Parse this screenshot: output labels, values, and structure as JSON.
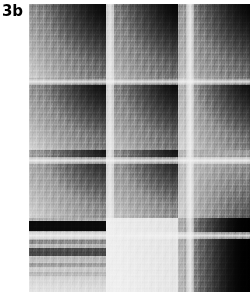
{
  "figure": {
    "panel_label": "3b",
    "type": "grayscale-heatmap"
  },
  "chart_data": {
    "type": "heatmap",
    "title": "3b",
    "xlabel": "",
    "ylabel": "",
    "colormap": "grayscale",
    "colormap_low": "#000000",
    "colormap_high": "#ffffff",
    "grid": false,
    "legend": "none",
    "xtick_labels": [],
    "ytick_labels": [],
    "plot_area": {
      "x": 29,
      "y": 4,
      "width": 221,
      "height": 288
    },
    "block_structure": {
      "column_group_widths_px": [
        77,
        72,
        72
      ],
      "row_group_heights_px": [
        74,
        72,
        68,
        74
      ],
      "column_gutter_px": 8,
      "row_gutter_px": 7
    },
    "blocks": [
      {
        "row": 0,
        "col": 0,
        "corner_dark": "top-right",
        "min_value": 0.04,
        "max_value": 0.78,
        "c_tl": "#8f8f8f",
        "c_tr": "#121212",
        "c_bl": "#d2d2d2",
        "c_br": "#6e6e6e"
      },
      {
        "row": 0,
        "col": 1,
        "corner_dark": "top-right",
        "min_value": 0.02,
        "max_value": 0.74,
        "c_tl": "#8a8a8a",
        "c_tr": "#0a0a0a",
        "c_bl": "#c9c9c9",
        "c_br": "#686868"
      },
      {
        "row": 0,
        "col": 2,
        "corner_dark": "top-right",
        "min_value": 0.03,
        "max_value": 0.72,
        "c_tl": "#9a9a9a",
        "c_tr": "#0d0d0d",
        "c_bl": "#c6c6c6",
        "c_br": "#6a6a6a"
      },
      {
        "row": 1,
        "col": 0,
        "corner_dark": "top-right",
        "min_value": 0.06,
        "max_value": 0.8,
        "c_tl": "#8d8d8d",
        "c_tr": "#1a1a1a",
        "c_bl": "#d6d6d6",
        "c_br": "#7c7c7c"
      },
      {
        "row": 1,
        "col": 1,
        "corner_dark": "top-right",
        "min_value": 0.05,
        "max_value": 0.76,
        "c_tl": "#8b8b8b",
        "c_tr": "#141414",
        "c_bl": "#cfcfcf",
        "c_br": "#6f6f6f"
      },
      {
        "row": 1,
        "col": 2,
        "corner_dark": "top-right",
        "min_value": 0.05,
        "max_value": 0.82,
        "c_tl": "#b4b4b4",
        "c_tr": "#1c1c1c",
        "c_bl": "#d8d8d8",
        "c_br": "#7a7a7a"
      },
      {
        "row": 2,
        "col": 0,
        "corner_dark": "top-right",
        "min_value": 0.22,
        "max_value": 0.74,
        "c_tl": "#9f9f9f",
        "c_tr": "#4b4b4b",
        "c_bl": "#d4d4d4",
        "c_br": "#909090"
      },
      {
        "row": 2,
        "col": 1,
        "corner_dark": "top-right",
        "min_value": 0.18,
        "max_value": 0.72,
        "c_tl": "#9a9a9a",
        "c_tr": "#3e3e3e",
        "c_bl": "#d0d0d0",
        "c_br": "#8c8c8c"
      },
      {
        "row": 2,
        "col": 2,
        "corner_dark": "bottom-right",
        "min_value": 0.3,
        "max_value": 0.8,
        "c_tl": "#b8b8b8",
        "c_tr": "#9c9c9c",
        "c_bl": "#d6d6d6",
        "c_br": "#868686"
      },
      {
        "row": 3,
        "col": 0,
        "corner_dark": "banded",
        "min_value": 0.08,
        "max_value": 0.86,
        "c_tl": "#b0b0b0",
        "c_tr": "#a8a8a8",
        "c_bl": "#cfcfcf",
        "c_br": "#c4c4c4"
      },
      {
        "row": 3,
        "col": 1,
        "corner_dark": "none",
        "min_value": 0.78,
        "max_value": 0.96,
        "c_tl": "#ededed",
        "c_tr": "#e2e2e2",
        "c_bl": "#f2f2f2",
        "c_br": "#e6e6e6"
      },
      {
        "row": 3,
        "col": 2,
        "corner_dark": "right",
        "min_value": 0.02,
        "max_value": 0.8,
        "c_tl": "#b4b4b4",
        "c_tr": "#060606",
        "c_bl": "#c2c2c2",
        "c_br": "#050505"
      }
    ],
    "row3_col0_stripes": [
      {
        "top_px": 3,
        "height_px": 10,
        "color": "#0a0a0a",
        "value": 0.03
      },
      {
        "top_px": 22,
        "height_px": 4,
        "color": "#8e8e8e",
        "value": 0.45
      },
      {
        "top_px": 30,
        "height_px": 8,
        "color": "#4a4a4a",
        "value": 0.22
      },
      {
        "top_px": 45,
        "height_px": 4,
        "color": "#9b9b9b",
        "value": 0.5
      },
      {
        "top_px": 54,
        "height_px": 4,
        "color": "#a5a5a5",
        "value": 0.55
      }
    ],
    "gutters_vertical_px": [
      77,
      157
    ],
    "gutters_horizontal_px": [
      74,
      153,
      228
    ],
    "gutter_color": "#e9e9e9"
  }
}
